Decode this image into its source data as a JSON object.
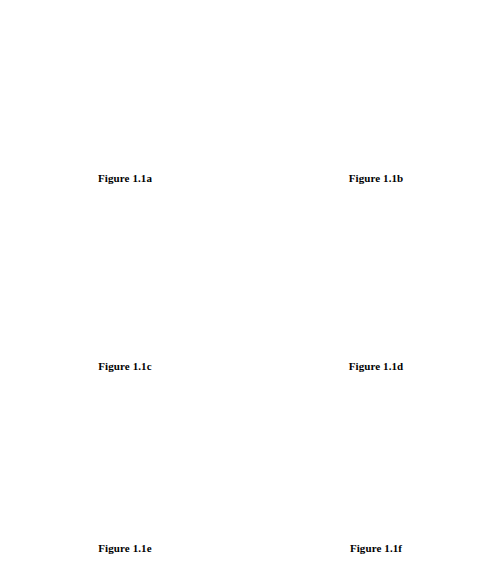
{
  "page": {
    "background": "#ffffff",
    "ink": "#000000",
    "width": 501,
    "height": 568
  },
  "figures": [
    {
      "id": "fig-1-1-a",
      "caption": "Figure 1.1a",
      "plot_type": "scatter",
      "x_tick_labels": [
        "2",
        "3",
        "4",
        "5",
        "6",
        "7"
      ],
      "x_tick_values": [
        2,
        3,
        4,
        5,
        6,
        7
      ],
      "y_tick_labels": [
        "5",
        "4",
        "3",
        "2",
        "1",
        "−1",
        "−2",
        "−3"
      ],
      "y_tick_values": [
        5,
        4,
        3,
        2,
        1,
        -1,
        -2,
        -3
      ],
      "x_range": [
        0,
        8.2
      ],
      "y_range": [
        -3,
        5
      ]
    },
    {
      "id": "fig-1-1-b",
      "caption": "Figure 1.1b",
      "plot_type": "bar",
      "x_tick_labels": [
        "2",
        "4",
        "6",
        "8"
      ],
      "x_tick_values": [
        2,
        4,
        6,
        8
      ],
      "y_tick_labels": [
        "5",
        "4",
        "3",
        "2",
        "1",
        "−1",
        "−2",
        "−3"
      ],
      "y_tick_values": [
        5,
        4,
        3,
        2,
        1,
        -1,
        -2,
        -3
      ],
      "x_range": [
        0,
        9.4
      ],
      "y_range": [
        -3,
        5
      ],
      "bar_width": 0.26
    },
    {
      "id": "fig-1-1-c",
      "caption": "Figure 1.1c",
      "plot_type": "line",
      "interpolation": "triangular-spike",
      "x_tick_labels": [
        "2",
        "4",
        "6",
        "8"
      ],
      "x_tick_values": [
        2,
        4,
        6,
        8
      ],
      "y_tick_labels": [
        "5",
        "4",
        "3",
        "2",
        "1",
        "−1",
        "−2",
        "−3"
      ],
      "y_tick_values": [
        5,
        4,
        3,
        2,
        1,
        -1,
        -2,
        -3
      ],
      "x_range": [
        0,
        9.4
      ],
      "y_range": [
        -3,
        5
      ],
      "spike_half_width": 0.42
    },
    {
      "id": "fig-1-1-d",
      "caption": "Figure 1.1d",
      "plot_type": "line",
      "interpolation": "gaussian-bump",
      "x_tick_labels": [
        "2",
        "4",
        "6",
        "8"
      ],
      "x_tick_values": [
        2,
        4,
        6,
        8
      ],
      "y_tick_labels": [
        "5",
        "4",
        "3",
        "2",
        "1",
        "−1",
        "−2",
        "−3"
      ],
      "y_tick_values": [
        5,
        4,
        3,
        2,
        1,
        -1,
        -2,
        -3
      ],
      "x_range": [
        0,
        9.4
      ],
      "y_range": [
        -3,
        5
      ],
      "bump_sigma": 0.21
    },
    {
      "id": "fig-1-1-e",
      "caption": "Figure 1.1e",
      "plot_type": "line",
      "interpolation": "piecewise-linear",
      "x_tick_labels": [
        "2",
        "4",
        "6",
        "8"
      ],
      "x_tick_values": [
        2,
        4,
        6,
        8
      ],
      "y_tick_labels": [
        "5",
        "4",
        "3",
        "2",
        "1",
        "−1",
        "−2",
        "−3"
      ],
      "y_tick_values": [
        5,
        4,
        3,
        2,
        1,
        -1,
        -2,
        -3
      ],
      "x_range": [
        0,
        9.4
      ],
      "y_range": [
        -3,
        5
      ]
    },
    {
      "id": "fig-1-1-f",
      "caption": "Figure 1.1f",
      "plot_type": "line",
      "interpolation": "cusped-smooth",
      "x_tick_labels": [
        "2",
        "4",
        "6",
        "8"
      ],
      "x_tick_values": [
        2,
        4,
        6,
        8
      ],
      "y_tick_labels": [
        "5",
        "4",
        "3",
        "2",
        "1",
        "−1",
        "−2",
        "−3"
      ],
      "y_tick_values": [
        5,
        4,
        3,
        2,
        1,
        -1,
        -2,
        -3
      ],
      "x_range": [
        0,
        9.4
      ],
      "y_range": [
        -3,
        5
      ]
    }
  ],
  "chart_data": [
    {
      "type": "scatter",
      "title": "Figure 1.1a",
      "xlabel": "",
      "ylabel": "",
      "x": [
        1.1,
        3.55,
        4.3,
        6.1,
        7.7
      ],
      "values": [
        1.1,
        3.1,
        -1.35,
        2.7,
        1.4
      ],
      "xlim": [
        0,
        8.2
      ],
      "ylim": [
        -3,
        5
      ],
      "xticks": [
        2,
        3,
        4,
        5,
        6,
        7
      ],
      "yticks": [
        -3,
        -2,
        -1,
        1,
        2,
        3,
        4,
        5
      ],
      "grid": false,
      "legend": "none"
    },
    {
      "type": "bar",
      "title": "Figure 1.1b",
      "xlabel": "",
      "ylabel": "",
      "categories": [
        1.1,
        3.55,
        4.3,
        6.1,
        7.7
      ],
      "values": [
        1.1,
        3.1,
        -1.35,
        2.7,
        1.4
      ],
      "xlim": [
        0,
        9.4
      ],
      "ylim": [
        -3,
        5
      ],
      "xticks": [
        2,
        4,
        6,
        8
      ],
      "yticks": [
        -3,
        -2,
        -1,
        1,
        2,
        3,
        4,
        5
      ],
      "grid": false,
      "legend": "none"
    },
    {
      "type": "line",
      "title": "Figure 1.1c",
      "xlabel": "",
      "ylabel": "",
      "x": [
        1.1,
        3.55,
        4.3,
        6.1,
        7.7
      ],
      "values": [
        1.1,
        3.1,
        -1.35,
        2.7,
        1.4
      ],
      "xlim": [
        0,
        9.4
      ],
      "ylim": [
        -3,
        5
      ],
      "xticks": [
        2,
        4,
        6,
        8
      ],
      "yticks": [
        -3,
        -2,
        -1,
        1,
        2,
        3,
        4,
        5
      ],
      "grid": false,
      "legend": "none"
    },
    {
      "type": "line",
      "title": "Figure 1.1d",
      "xlabel": "",
      "ylabel": "",
      "x": [
        1.1,
        3.55,
        4.3,
        6.1,
        7.7
      ],
      "values": [
        1.1,
        3.1,
        -1.35,
        2.7,
        1.4
      ],
      "xlim": [
        0,
        9.4
      ],
      "ylim": [
        -3,
        5
      ],
      "xticks": [
        2,
        4,
        6,
        8
      ],
      "yticks": [
        -3,
        -2,
        -1,
        1,
        2,
        3,
        4,
        5
      ],
      "grid": false,
      "legend": "none"
    },
    {
      "type": "line",
      "title": "Figure 1.1e",
      "xlabel": "",
      "ylabel": "",
      "x": [
        0,
        1.1,
        3.55,
        4.3,
        6.1,
        7.7,
        9.1
      ],
      "values": [
        1.6,
        1.15,
        3.1,
        -1.35,
        2.7,
        1.4,
        1.9
      ],
      "xlim": [
        0,
        9.4
      ],
      "ylim": [
        -3,
        5
      ],
      "xticks": [
        2,
        4,
        6,
        8
      ],
      "yticks": [
        -3,
        -2,
        -1,
        1,
        2,
        3,
        4,
        5
      ],
      "grid": false,
      "legend": "none"
    },
    {
      "type": "line",
      "title": "Figure 1.1f",
      "xlabel": "",
      "ylabel": "",
      "x": [
        0,
        1.1,
        3.55,
        4.3,
        6.1,
        7.7,
        9.1
      ],
      "values": [
        1.85,
        1.3,
        2.95,
        -1.35,
        2.5,
        1.5,
        2.05
      ],
      "xlim": [
        0,
        9.4
      ],
      "ylim": [
        -3,
        5
      ],
      "xticks": [
        2,
        4,
        6,
        8
      ],
      "yticks": [
        -3,
        -2,
        -1,
        1,
        2,
        3,
        4,
        5
      ],
      "grid": false,
      "legend": "none"
    }
  ]
}
